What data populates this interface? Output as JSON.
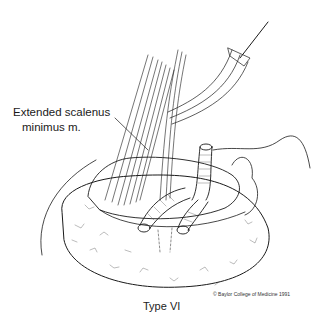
{
  "figure": {
    "title": "Type VI",
    "annotation": {
      "line1": "Extended scalenus",
      "line2": "minimus m."
    },
    "copyright": "© Baylor College of Medicine 1991",
    "colors": {
      "ink": "#1a1a1a",
      "background": "#ffffff"
    }
  }
}
